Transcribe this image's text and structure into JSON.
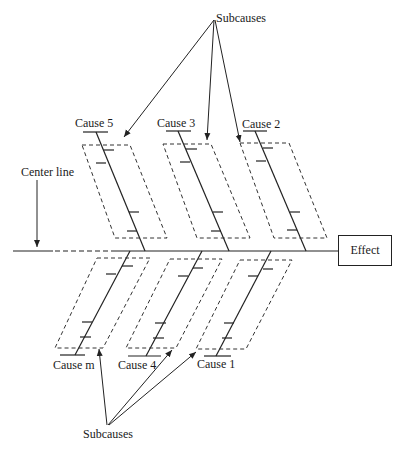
{
  "diagram": {
    "type": "fishbone",
    "effect_label": "Effect",
    "center_line_label": "Center line",
    "subcauses_top_label": "Subcauses",
    "subcauses_bottom_label": "Subcauses",
    "causes_top": [
      {
        "id": "cause5",
        "label": "Cause 5"
      },
      {
        "id": "cause3",
        "label": "Cause 3"
      },
      {
        "id": "cause2",
        "label": "Cause 2"
      }
    ],
    "causes_bottom": [
      {
        "id": "causem",
        "label": "Cause m"
      },
      {
        "id": "cause4",
        "label": "Cause 4"
      },
      {
        "id": "cause1",
        "label": "Cause 1"
      }
    ],
    "colors": {
      "line": "#222222",
      "dashed": "#333333",
      "background": "#ffffff"
    }
  }
}
